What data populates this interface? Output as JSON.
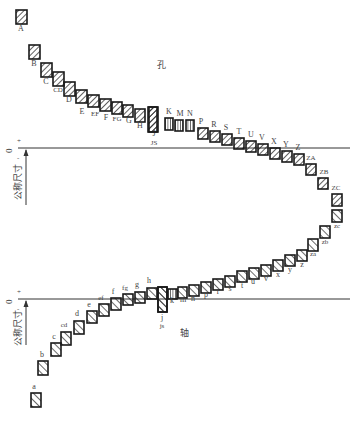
{
  "diagram": {
    "colors": {
      "stroke": "#1a1a1a",
      "text": "#444444",
      "line": "#333333"
    },
    "hole_section": {
      "label": "孔",
      "zero_line_y": 148,
      "axis_label": "公称尺寸",
      "zero_mark": "0",
      "plus_mark": "+",
      "minus_mark": "-",
      "boxes": [
        {
          "label": "A",
          "x": 16,
          "y": 10,
          "w": 11,
          "h": 14,
          "lx": 21,
          "ly": 31
        },
        {
          "label": "B",
          "x": 29,
          "y": 45,
          "w": 11,
          "h": 14,
          "lx": 34,
          "ly": 66
        },
        {
          "label": "C",
          "x": 41,
          "y": 63,
          "w": 11,
          "h": 14,
          "lx": 46,
          "ly": 84
        },
        {
          "label": "CD",
          "x": 53,
          "y": 72,
          "w": 11,
          "h": 14,
          "lx": 58,
          "ly": 92
        },
        {
          "label": "D",
          "x": 64,
          "y": 82,
          "w": 11,
          "h": 14,
          "lx": 69,
          "ly": 102
        },
        {
          "label": "E",
          "x": 76,
          "y": 90,
          "w": 11,
          "h": 13,
          "lx": 82,
          "ly": 114
        },
        {
          "label": "EF",
          "x": 88,
          "y": 95,
          "w": 11,
          "h": 12,
          "lx": 95,
          "ly": 116
        },
        {
          "label": "F",
          "x": 100,
          "y": 99,
          "w": 11,
          "h": 12,
          "lx": 106,
          "ly": 120
        },
        {
          "label": "FG",
          "x": 112,
          "y": 102,
          "w": 10,
          "h": 12,
          "lx": 117,
          "ly": 121
        },
        {
          "label": "G",
          "x": 123,
          "y": 105,
          "w": 10,
          "h": 12,
          "lx": 129,
          "ly": 123
        },
        {
          "label": "H",
          "x": 135,
          "y": 109,
          "w": 10,
          "h": 13,
          "lx": 140,
          "ly": 128
        },
        {
          "label": "J",
          "x": 149,
          "y": 107,
          "w": 9,
          "h": 25,
          "lx": 154,
          "ly": 136
        },
        {
          "label": "JS",
          "x": 148,
          "y": 107,
          "w": 9,
          "h": 25,
          "lx": 154,
          "ly": 145
        },
        {
          "label": "K",
          "x": 165,
          "y": 118,
          "w": 8,
          "h": 12,
          "lx": 169,
          "ly": 114,
          "type": "dense"
        },
        {
          "label": "M",
          "x": 175,
          "y": 120,
          "w": 8,
          "h": 11,
          "lx": 180,
          "ly": 116,
          "type": "dense"
        },
        {
          "label": "N",
          "x": 186,
          "y": 120,
          "w": 8,
          "h": 11,
          "lx": 190,
          "ly": 116,
          "type": "dense"
        },
        {
          "label": "P",
          "x": 198,
          "y": 128,
          "w": 10,
          "h": 11,
          "lx": 201,
          "ly": 124
        },
        {
          "label": "R",
          "x": 210,
          "y": 131,
          "w": 10,
          "h": 11,
          "lx": 214,
          "ly": 127
        },
        {
          "label": "S",
          "x": 222,
          "y": 134,
          "w": 10,
          "h": 11,
          "lx": 226,
          "ly": 130
        },
        {
          "label": "T",
          "x": 234,
          "y": 138,
          "w": 10,
          "h": 11,
          "lx": 239,
          "ly": 134
        },
        {
          "label": "U",
          "x": 246,
          "y": 141,
          "w": 10,
          "h": 11,
          "lx": 251,
          "ly": 137
        },
        {
          "label": "V",
          "x": 258,
          "y": 144,
          "w": 10,
          "h": 11,
          "lx": 262,
          "ly": 140
        },
        {
          "label": "X",
          "x": 270,
          "y": 148,
          "w": 10,
          "h": 11,
          "lx": 274,
          "ly": 144
        },
        {
          "label": "Y",
          "x": 282,
          "y": 151,
          "w": 10,
          "h": 11,
          "lx": 286,
          "ly": 147
        },
        {
          "label": "Z",
          "x": 294,
          "y": 154,
          "w": 10,
          "h": 11,
          "lx": 298,
          "ly": 150
        },
        {
          "label": "ZA",
          "x": 306,
          "y": 164,
          "w": 10,
          "h": 11,
          "lx": 311,
          "ly": 160
        },
        {
          "label": "ZB",
          "x": 318,
          "y": 178,
          "w": 10,
          "h": 11,
          "lx": 324,
          "ly": 174
        },
        {
          "label": "ZC",
          "x": 332,
          "y": 194,
          "w": 10,
          "h": 12,
          "lx": 336,
          "ly": 190
        }
      ]
    },
    "shaft_section": {
      "label": "轴",
      "zero_line_y": 299,
      "axis_label": "公称尺寸",
      "zero_mark": "0",
      "plus_mark": "+",
      "minus_mark": "-",
      "boxes": [
        {
          "label": "zc",
          "x": 332,
          "y": 210,
          "w": 10,
          "h": 12,
          "lx": 337,
          "ly": 228
        },
        {
          "label": "zb",
          "x": 320,
          "y": 226,
          "w": 10,
          "h": 12,
          "lx": 325,
          "ly": 244
        },
        {
          "label": "za",
          "x": 308,
          "y": 239,
          "w": 10,
          "h": 12,
          "lx": 313,
          "ly": 256
        },
        {
          "label": "z",
          "x": 297,
          "y": 250,
          "w": 10,
          "h": 11,
          "lx": 302,
          "ly": 267
        },
        {
          "label": "y",
          "x": 285,
          "y": 255,
          "w": 10,
          "h": 11,
          "lx": 290,
          "ly": 272
        },
        {
          "label": "x",
          "x": 273,
          "y": 260,
          "w": 10,
          "h": 11,
          "lx": 278,
          "ly": 277
        },
        {
          "label": "v",
          "x": 261,
          "y": 265,
          "w": 10,
          "h": 11,
          "lx": 266,
          "ly": 281
        },
        {
          "label": "u",
          "x": 249,
          "y": 268,
          "w": 10,
          "h": 11,
          "lx": 253,
          "ly": 284
        },
        {
          "label": "t",
          "x": 237,
          "y": 271,
          "w": 10,
          "h": 11,
          "lx": 242,
          "ly": 288
        },
        {
          "label": "s",
          "x": 225,
          "y": 276,
          "w": 10,
          "h": 11,
          "lx": 230,
          "ly": 291
        },
        {
          "label": "r",
          "x": 213,
          "y": 279,
          "w": 10,
          "h": 11,
          "lx": 218,
          "ly": 294
        },
        {
          "label": "p",
          "x": 201,
          "y": 282,
          "w": 10,
          "h": 11,
          "lx": 206,
          "ly": 297
        },
        {
          "label": "n",
          "x": 189,
          "y": 285,
          "w": 10,
          "h": 11,
          "lx": 193,
          "ly": 301
        },
        {
          "label": "m",
          "x": 178,
          "y": 287,
          "w": 9,
          "h": 11,
          "lx": 183,
          "ly": 302
        },
        {
          "label": "k",
          "x": 168,
          "y": 289,
          "w": 9,
          "h": 10,
          "lx": 172,
          "ly": 303,
          "type": "dense"
        },
        {
          "label": "j",
          "x": 158,
          "y": 287,
          "w": 9,
          "h": 25,
          "lx": 162,
          "ly": 320
        },
        {
          "label": "js",
          "x": 158,
          "y": 287,
          "w": 9,
          "h": 25,
          "lx": 162,
          "ly": 328
        },
        {
          "label": "h",
          "x": 147,
          "y": 288,
          "w": 10,
          "h": 11,
          "lx": 149,
          "ly": 283
        },
        {
          "label": "g",
          "x": 135,
          "y": 292,
          "w": 10,
          "h": 11,
          "lx": 137,
          "ly": 287
        },
        {
          "label": "fg",
          "x": 123,
          "y": 294,
          "w": 10,
          "h": 11,
          "lx": 125,
          "ly": 290
        },
        {
          "label": "f",
          "x": 111,
          "y": 298,
          "w": 10,
          "h": 12,
          "lx": 113,
          "ly": 294
        },
        {
          "label": "ef",
          "x": 99,
          "y": 304,
          "w": 10,
          "h": 12,
          "lx": 101,
          "ly": 300
        },
        {
          "label": "e",
          "x": 87,
          "y": 311,
          "w": 10,
          "h": 12,
          "lx": 89,
          "ly": 307
        },
        {
          "label": "d",
          "x": 74,
          "y": 321,
          "w": 10,
          "h": 13,
          "lx": 77,
          "ly": 316
        },
        {
          "label": "cd",
          "x": 61,
          "y": 332,
          "w": 10,
          "h": 13,
          "lx": 64,
          "ly": 327
        },
        {
          "label": "c",
          "x": 51,
          "y": 343,
          "w": 10,
          "h": 13,
          "lx": 54,
          "ly": 339
        },
        {
          "label": "b",
          "x": 38,
          "y": 361,
          "w": 10,
          "h": 14,
          "lx": 42,
          "ly": 357
        },
        {
          "label": "a",
          "x": 31,
          "y": 393,
          "w": 10,
          "h": 14,
          "lx": 34,
          "ly": 389
        }
      ]
    }
  }
}
